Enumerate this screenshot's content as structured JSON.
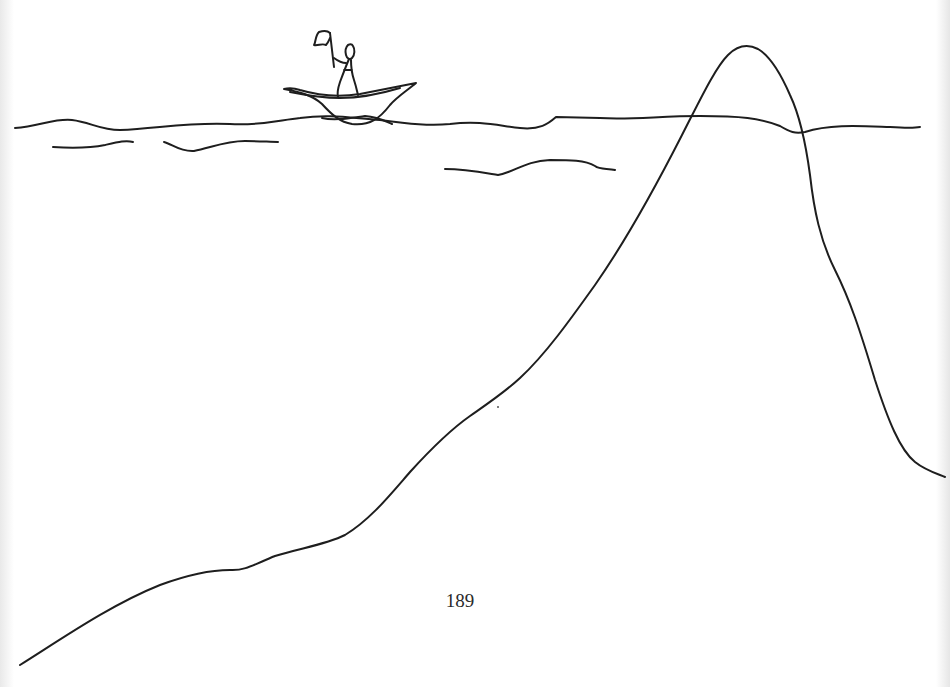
{
  "page": {
    "page_number": "189",
    "illustration": {
      "description": "Hand-drawn sketch: a stick figure holding a flag stands in a small boat on wavy water, while a large mountain/iceberg shape rises from the bottom-left, peaks above the waterline, and descends on the right.",
      "elements": [
        "stick-figure-with-flag",
        "boat",
        "water-surface-line",
        "water-ripple-lines",
        "submerged-mountain-outline"
      ],
      "line_color": "#1e1e1e",
      "background_color": "#ffffff"
    }
  }
}
